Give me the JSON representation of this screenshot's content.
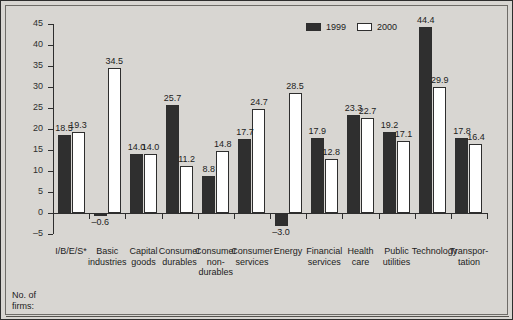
{
  "legend": {
    "series": [
      {
        "name": "1999",
        "swatch": "dark"
      },
      {
        "name": "2000",
        "swatch": "light"
      }
    ]
  },
  "axis": {
    "y_ticks": [
      "45",
      "40",
      "35",
      "30",
      "25",
      "20",
      "15",
      "10",
      "5",
      "0",
      "-5"
    ]
  },
  "footer": {
    "no_of": "No. of",
    "firms": "firms:"
  },
  "chart_data": {
    "type": "bar",
    "title": "",
    "xlabel": "",
    "ylabel": "",
    "ylim": [
      -5,
      45
    ],
    "ytick_step": 5,
    "grid": false,
    "legend_position": "top-right",
    "categories": [
      "I/B/E/S*",
      "Basic industries",
      "Capital goods",
      "Consumer durables",
      "Consumer non-durables",
      "Consumer services",
      "Energy",
      "Financial services",
      "Health care",
      "Public utilities",
      "Technology",
      "Transportation"
    ],
    "category_lines": [
      [
        "I/B/E/S*"
      ],
      [
        "Basic",
        "industries"
      ],
      [
        "Capital",
        "goods"
      ],
      [
        "Consumer",
        "durables"
      ],
      [
        "Consumer",
        "non-",
        "durables"
      ],
      [
        "Consumer",
        "services"
      ],
      [
        "Energy"
      ],
      [
        "Financial",
        "services"
      ],
      [
        "Health",
        "care"
      ],
      [
        "Public",
        "utilities"
      ],
      [
        "Technology"
      ],
      [
        "Transpor-",
        "tation"
      ]
    ],
    "series": [
      {
        "name": "1999",
        "values": [
          18.5,
          -0.6,
          14.0,
          25.7,
          8.8,
          17.7,
          -3.0,
          17.9,
          23.3,
          19.2,
          44.4,
          17.8
        ],
        "labels": [
          "18.5",
          "-0.6",
          "14.0",
          "25.7",
          "8.8",
          "17.7",
          "-3.0",
          "17.9",
          "23.3",
          "19.2",
          "44.4",
          "17.8"
        ]
      },
      {
        "name": "2000",
        "values": [
          19.3,
          34.5,
          14.0,
          11.2,
          14.8,
          24.7,
          28.5,
          12.8,
          22.7,
          17.1,
          29.9,
          16.4
        ],
        "labels": [
          "19.3",
          "34.5",
          "14.0",
          "11.2",
          "14.8",
          "24.7",
          "28.5",
          "12.8",
          "22.7",
          "17.1",
          "29.9",
          "16.4"
        ]
      }
    ],
    "no_of_firms": [
      "5779",
      "279",
      "424",
      "203",
      "240",
      "912",
      "242",
      "971",
      "612",
      "230",
      "958",
      "105"
    ]
  }
}
